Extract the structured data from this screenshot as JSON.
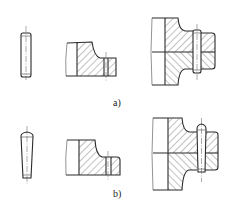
{
  "figure": {
    "type": "technical-drawing",
    "colors": {
      "line": "#2a2a2a",
      "background": "#ffffff"
    },
    "panels": [
      {
        "id": "a",
        "label": "a)",
        "pin_type": "cylindrical pin",
        "parts": [
          "pin-side-view",
          "part-with-hole-section",
          "assembled-joint-section"
        ]
      },
      {
        "id": "b",
        "label": "b)",
        "pin_type": "taper pin",
        "parts": [
          "pin-side-view",
          "part-with-hole-section",
          "assembled-joint-section"
        ]
      }
    ]
  }
}
